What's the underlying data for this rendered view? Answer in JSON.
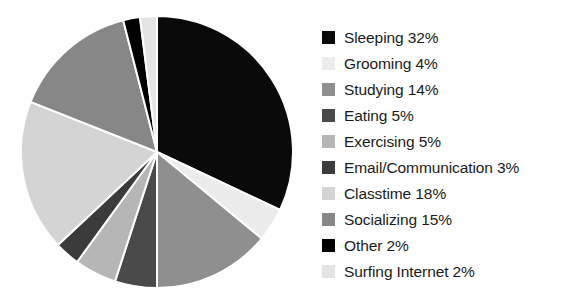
{
  "chart_data": {
    "type": "pie",
    "title": "",
    "legend_position": "right",
    "start_angle_deg": 0,
    "direction": "clockwise",
    "categories": [
      "Sleeping",
      "Grooming",
      "Studying",
      "Eating",
      "Exercising",
      "Email/Communication",
      "Classtime",
      "Socializing",
      "Other",
      "Surfing Internet"
    ],
    "values": [
      32,
      4,
      14,
      5,
      5,
      3,
      18,
      15,
      2,
      2
    ],
    "unit": "%",
    "colors": [
      "#0a0a0a",
      "#ececec",
      "#8f8f8f",
      "#4a4a4a",
      "#b6b6b6",
      "#3b3b3b",
      "#d4d4d4",
      "#878787",
      "#000000",
      "#e4e4e4"
    ],
    "slices": [
      {
        "label": "Sleeping",
        "value": 32,
        "display": "Sleeping 32%",
        "color": "#0a0a0a"
      },
      {
        "label": "Grooming",
        "value": 4,
        "display": "Grooming 4%",
        "color": "#ececec"
      },
      {
        "label": "Studying",
        "value": 14,
        "display": "Studying 14%",
        "color": "#8f8f8f"
      },
      {
        "label": "Eating",
        "value": 5,
        "display": "Eating 5%",
        "color": "#4a4a4a"
      },
      {
        "label": "Exercising",
        "value": 5,
        "display": "Exercising 5%",
        "color": "#b6b6b6"
      },
      {
        "label": "Email/Communication",
        "value": 3,
        "display": "Email/Communication 3%",
        "color": "#3b3b3b"
      },
      {
        "label": "Classtime",
        "value": 18,
        "display": "Classtime 18%",
        "color": "#d4d4d4"
      },
      {
        "label": "Socializing",
        "value": 15,
        "display": "Socializing 15%",
        "color": "#878787"
      },
      {
        "label": "Other",
        "value": 2,
        "display": "Other 2%",
        "color": "#000000"
      },
      {
        "label": "Surfing Internet",
        "value": 2,
        "display": "Surfing Internet 2%",
        "color": "#e4e4e4"
      }
    ],
    "geometry": {
      "cx": 157,
      "cy": 152,
      "r": 136,
      "separator_color": "#ffffff",
      "separator_width": 2
    }
  }
}
